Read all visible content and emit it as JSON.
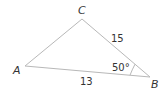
{
  "diagram": {
    "type": "triangle",
    "vertices": {
      "A": {
        "label": "A",
        "x": 25,
        "y": 66
      },
      "B": {
        "label": "B",
        "x": 150,
        "y": 77
      },
      "C": {
        "label": "C",
        "x": 82,
        "y": 19
      }
    },
    "sides": {
      "AB": {
        "label": "13"
      },
      "BC": {
        "label": "15"
      },
      "CA": {
        "label": ""
      }
    },
    "angles": {
      "B": {
        "label": "50°"
      }
    },
    "colors": {
      "stroke": "#b8b8b8",
      "text": "#333333",
      "background": "#ffffff"
    }
  }
}
